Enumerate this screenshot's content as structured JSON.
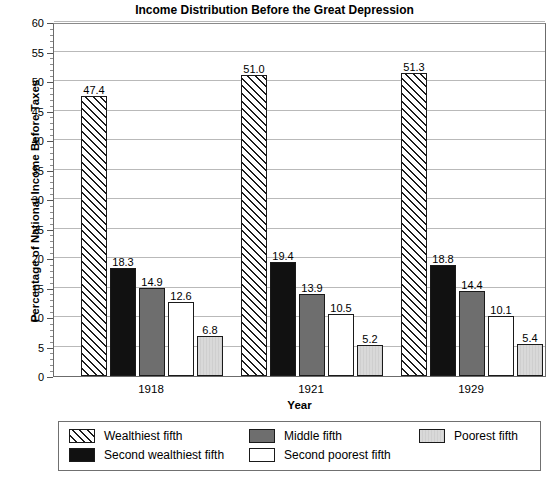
{
  "chart_data": {
    "type": "bar",
    "title": "Income Distribution Before the Great Depression",
    "xlabel": "Year",
    "ylabel": "Percentage of National Income Before Taxes",
    "categories": [
      "1918",
      "1921",
      "1929"
    ],
    "ylim": [
      0,
      60
    ],
    "ytick_step": 5,
    "yticks": [
      "0",
      "5",
      "10",
      "15",
      "20",
      "25",
      "30",
      "35",
      "40",
      "45",
      "50",
      "55",
      "60"
    ],
    "minor_tick_step": 1,
    "grid": "horizontal-major",
    "legend_position": "below-plot",
    "series": [
      {
        "name": "Wealthiest fifth",
        "pattern": "diagonal-hatch",
        "color": "#ffffff",
        "values": [
          47.4,
          51.0,
          51.3
        ],
        "labels": [
          "47.4",
          "51.0",
          "51.3"
        ]
      },
      {
        "name": "Second wealthiest fifth",
        "pattern": "solid",
        "color": "#111111",
        "values": [
          18.3,
          19.4,
          18.8
        ],
        "labels": [
          "18.3",
          "19.4",
          "18.8"
        ]
      },
      {
        "name": "Middle fifth",
        "pattern": "solid",
        "color": "#6e6e6e",
        "values": [
          14.9,
          13.9,
          14.4
        ],
        "labels": [
          "14.9",
          "13.9",
          "14.4"
        ]
      },
      {
        "name": "Second poorest fifth",
        "pattern": "solid",
        "color": "#ffffff",
        "values": [
          12.6,
          10.5,
          10.1
        ],
        "labels": [
          "12.6",
          "10.5",
          "10.1"
        ]
      },
      {
        "name": "Poorest fifth",
        "pattern": "vertical-stripe",
        "color": "#d9d9d9",
        "values": [
          6.8,
          5.2,
          5.4
        ],
        "labels": [
          "6.8",
          "5.2",
          "5.4"
        ]
      }
    ]
  },
  "legend": {
    "entries": [
      {
        "label": "Wealthiest fifth",
        "swatch": "hatch"
      },
      {
        "label": "Second wealthiest fifth",
        "swatch": "black"
      },
      {
        "label": "Middle fifth",
        "swatch": "midgray"
      },
      {
        "label": "Second poorest fifth",
        "swatch": "white"
      },
      {
        "label": "Poorest fifth",
        "swatch": "lightgray"
      }
    ]
  }
}
